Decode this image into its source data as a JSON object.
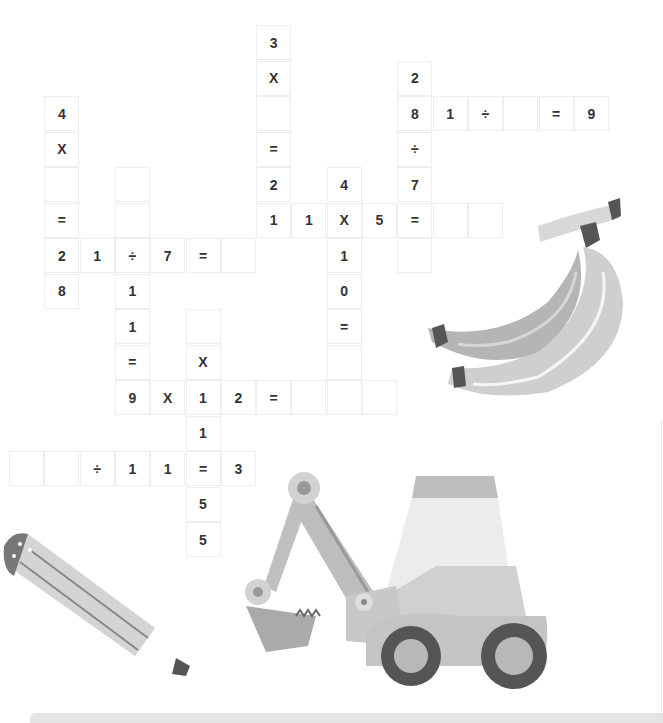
{
  "puzzle": {
    "type": "math-crossword",
    "grid_origin": {
      "x": 9,
      "y": 25
    },
    "cell_size": {
      "w": 35.3,
      "h": 35.5
    },
    "cells": [
      {
        "r": 0,
        "c": 7,
        "v": "3"
      },
      {
        "r": 1,
        "c": 7,
        "v": "X"
      },
      {
        "r": 1,
        "c": 11,
        "v": "2"
      },
      {
        "r": 2,
        "c": 1,
        "v": "4"
      },
      {
        "r": 2,
        "c": 7,
        "v": ""
      },
      {
        "r": 2,
        "c": 11,
        "v": "8"
      },
      {
        "r": 2,
        "c": 12,
        "v": "1"
      },
      {
        "r": 2,
        "c": 13,
        "v": "÷"
      },
      {
        "r": 2,
        "c": 14,
        "v": ""
      },
      {
        "r": 2,
        "c": 15,
        "v": "="
      },
      {
        "r": 2,
        "c": 16,
        "v": "9"
      },
      {
        "r": 3,
        "c": 1,
        "v": "X"
      },
      {
        "r": 3,
        "c": 7,
        "v": "="
      },
      {
        "r": 3,
        "c": 11,
        "v": "÷"
      },
      {
        "r": 4,
        "c": 1,
        "v": ""
      },
      {
        "r": 4,
        "c": 3,
        "v": ""
      },
      {
        "r": 4,
        "c": 7,
        "v": "2"
      },
      {
        "r": 4,
        "c": 9,
        "v": "4"
      },
      {
        "r": 4,
        "c": 11,
        "v": "7"
      },
      {
        "r": 5,
        "c": 1,
        "v": "="
      },
      {
        "r": 5,
        "c": 3,
        "v": ""
      },
      {
        "r": 5,
        "c": 7,
        "v": "1"
      },
      {
        "r": 5,
        "c": 8,
        "v": "1"
      },
      {
        "r": 5,
        "c": 9,
        "v": "X"
      },
      {
        "r": 5,
        "c": 10,
        "v": "5"
      },
      {
        "r": 5,
        "c": 11,
        "v": "="
      },
      {
        "r": 5,
        "c": 12,
        "v": ""
      },
      {
        "r": 5,
        "c": 13,
        "v": ""
      },
      {
        "r": 6,
        "c": 1,
        "v": "2"
      },
      {
        "r": 6,
        "c": 2,
        "v": "1"
      },
      {
        "r": 6,
        "c": 3,
        "v": "÷"
      },
      {
        "r": 6,
        "c": 4,
        "v": "7"
      },
      {
        "r": 6,
        "c": 5,
        "v": "="
      },
      {
        "r": 6,
        "c": 6,
        "v": ""
      },
      {
        "r": 6,
        "c": 9,
        "v": "1"
      },
      {
        "r": 6,
        "c": 11,
        "v": ""
      },
      {
        "r": 7,
        "c": 1,
        "v": "8"
      },
      {
        "r": 7,
        "c": 3,
        "v": "1"
      },
      {
        "r": 7,
        "c": 9,
        "v": "0"
      },
      {
        "r": 8,
        "c": 3,
        "v": "1"
      },
      {
        "r": 8,
        "c": 5,
        "v": ""
      },
      {
        "r": 8,
        "c": 9,
        "v": "="
      },
      {
        "r": 9,
        "c": 3,
        "v": "="
      },
      {
        "r": 9,
        "c": 5,
        "v": "X"
      },
      {
        "r": 9,
        "c": 9,
        "v": ""
      },
      {
        "r": 10,
        "c": 3,
        "v": "9"
      },
      {
        "r": 10,
        "c": 4,
        "v": "X"
      },
      {
        "r": 10,
        "c": 5,
        "v": "1"
      },
      {
        "r": 10,
        "c": 6,
        "v": "2"
      },
      {
        "r": 10,
        "c": 7,
        "v": "="
      },
      {
        "r": 10,
        "c": 8,
        "v": ""
      },
      {
        "r": 10,
        "c": 9,
        "v": ""
      },
      {
        "r": 10,
        "c": 10,
        "v": ""
      },
      {
        "r": 11,
        "c": 5,
        "v": "1"
      },
      {
        "r": 12,
        "c": 0,
        "v": ""
      },
      {
        "r": 12,
        "c": 1,
        "v": ""
      },
      {
        "r": 12,
        "c": 2,
        "v": "÷"
      },
      {
        "r": 12,
        "c": 3,
        "v": "1"
      },
      {
        "r": 12,
        "c": 4,
        "v": "1"
      },
      {
        "r": 12,
        "c": 5,
        "v": "="
      },
      {
        "r": 12,
        "c": 6,
        "v": "3"
      },
      {
        "r": 13,
        "c": 5,
        "v": "5"
      },
      {
        "r": 14,
        "c": 5,
        "v": "5"
      }
    ]
  },
  "illustrations": [
    "banana-bunch",
    "excavator",
    "pencil"
  ],
  "colors": {
    "cell_border": "#eeeeee",
    "text": "#333333",
    "light_gray": "#d4d4d4",
    "mid_gray": "#b4b4b4",
    "dark_gray": "#555555",
    "bottom_bar": "#e4e4e4"
  }
}
